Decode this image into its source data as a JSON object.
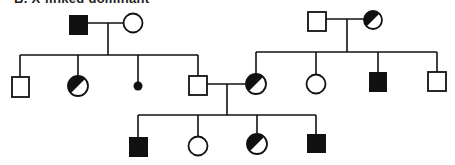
{
  "caption": {
    "text": "B. X-linked dominant",
    "note": "clipped at top edge; only the lower portions of the glyphs are visible, reading is uncertain"
  },
  "colors": {
    "ink": "#111111",
    "background": "#ffffff"
  },
  "legend_semantics": {
    "square": "male",
    "circle": "female",
    "filled": "affected",
    "half_filled": "carrier",
    "small_dot": "deceased in infancy / miscarriage"
  },
  "generations": [
    {
      "id": "I",
      "individuals": [
        {
          "id": "I-1",
          "sex": "male",
          "status": "affected",
          "x": 78,
          "y": 25
        },
        {
          "id": "I-2",
          "sex": "female",
          "status": "unaffected",
          "x": 133,
          "y": 25
        },
        {
          "id": "I-3",
          "sex": "male",
          "status": "unaffected",
          "x": 317,
          "y": 21
        },
        {
          "id": "I-4",
          "sex": "female",
          "status": "carrier",
          "x": 373,
          "y": 20
        }
      ]
    },
    {
      "id": "II",
      "individuals": [
        {
          "id": "II-1",
          "sex": "male",
          "status": "unaffected",
          "x": 20,
          "y": 87
        },
        {
          "id": "II-2",
          "sex": "female",
          "status": "carrier",
          "x": 78,
          "y": 86
        },
        {
          "id": "II-3",
          "sex": "unknown",
          "status": "infant-death",
          "x": 138,
          "y": 86
        },
        {
          "id": "II-4",
          "sex": "male",
          "status": "unaffected",
          "x": 198,
          "y": 85
        },
        {
          "id": "II-5",
          "sex": "female",
          "status": "carrier",
          "x": 256,
          "y": 84
        },
        {
          "id": "II-6",
          "sex": "female",
          "status": "unaffected",
          "x": 316,
          "y": 84
        },
        {
          "id": "II-7",
          "sex": "male",
          "status": "affected",
          "x": 378,
          "y": 82
        },
        {
          "id": "II-8",
          "sex": "male",
          "status": "unaffected",
          "x": 437,
          "y": 81
        }
      ]
    },
    {
      "id": "III",
      "individuals": [
        {
          "id": "III-1",
          "sex": "male",
          "status": "affected",
          "x": 138,
          "y": 147
        },
        {
          "id": "III-2",
          "sex": "female",
          "status": "unaffected",
          "x": 198,
          "y": 146
        },
        {
          "id": "III-3",
          "sex": "female",
          "status": "carrier",
          "x": 257,
          "y": 144
        },
        {
          "id": "III-4",
          "sex": "male",
          "status": "affected",
          "x": 316,
          "y": 144
        }
      ]
    }
  ]
}
